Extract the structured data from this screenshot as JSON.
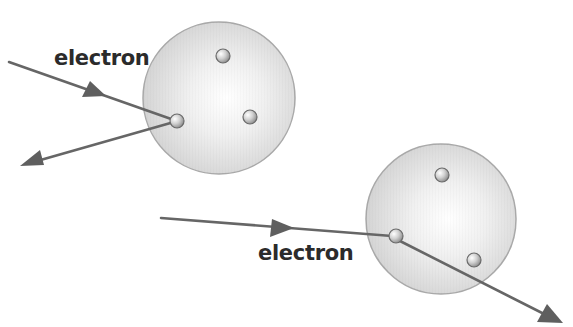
{
  "diagram": {
    "type": "electron scattering off atoms",
    "colors": {
      "sphere_fill": "#dcdcdc",
      "sphere_highlight": "#ffffff",
      "sphere_stroke": "#a9a9a9",
      "particle_fill": "#c8c8c8",
      "particle_stroke": "#6a6a6a",
      "track": "#666666",
      "label": "#2b2b2b"
    },
    "atoms": [
      {
        "id": "atom-1",
        "cx": 219,
        "cy": 98,
        "r": 76,
        "particles": [
          {
            "cx": 223,
            "cy": 56
          },
          {
            "cx": 250,
            "cy": 117
          },
          {
            "cx": 177,
            "cy": 121
          }
        ]
      },
      {
        "id": "atom-2",
        "cx": 441,
        "cy": 219,
        "r": 75,
        "particles": [
          {
            "cx": 442,
            "cy": 175
          },
          {
            "cx": 474,
            "cy": 260
          },
          {
            "cx": 396,
            "cy": 236
          }
        ]
      }
    ],
    "labels": [
      {
        "text": "electron",
        "x": 54,
        "y": 46
      },
      {
        "text": "electron",
        "x": 258,
        "y": 241
      }
    ],
    "tracks": [
      {
        "name": "incoming-1",
        "from": [
          9,
          62
        ],
        "to": [
          172,
          120
        ]
      },
      {
        "name": "outgoing-1",
        "from": [
          172,
          122
        ],
        "to": [
          22,
          165
        ]
      },
      {
        "name": "incoming-2",
        "from": [
          161,
          218
        ],
        "to": [
          390,
          236
        ]
      },
      {
        "name": "outgoing-2",
        "from": [
          400,
          240
        ],
        "to": [
          562,
          323
        ]
      }
    ]
  }
}
